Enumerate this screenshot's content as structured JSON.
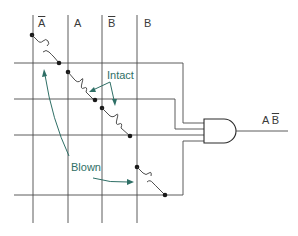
{
  "columns": [
    {
      "id": "a-bar",
      "letter": "A",
      "complement": true,
      "x": 33
    },
    {
      "id": "a",
      "letter": "A",
      "complement": false,
      "x": 68
    },
    {
      "id": "b-bar",
      "letter": "B",
      "complement": true,
      "x": 102
    },
    {
      "id": "b",
      "letter": "B",
      "complement": false,
      "x": 137
    }
  ],
  "rows_y": [
    63,
    99,
    135,
    195
  ],
  "fuses": [
    {
      "state": "blown",
      "from_column": "a-bar",
      "row": 1
    },
    {
      "state": "intact",
      "from_column": "a",
      "row": 2
    },
    {
      "state": "intact",
      "from_column": "b-bar",
      "row": 3
    },
    {
      "state": "blown",
      "from_column": "b",
      "row": 4
    }
  ],
  "annotations": {
    "intact_label": "Intact",
    "blown_label": "Blown"
  },
  "gate": {
    "type": "AND",
    "inputs": 4
  },
  "output": {
    "term1": "A",
    "term2": "B",
    "term2_complement": true
  },
  "colors": {
    "wire": "#4a4a4a",
    "annotation": "#2f6f66"
  }
}
